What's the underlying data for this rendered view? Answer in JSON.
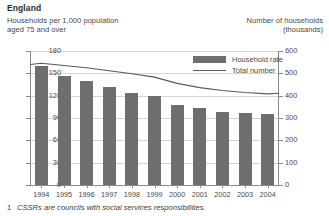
{
  "header": {
    "country": "England",
    "left_axis_title_line1": "Households per 1,000 population",
    "left_axis_title_line2": "aged 75 and over",
    "right_axis_title_line1": "Number of households",
    "right_axis_title_line2": "(thousands)"
  },
  "legend": {
    "position": "inside-top-right",
    "items": [
      {
        "label": "Household rate",
        "marker": "bar-swatch",
        "color": "#6e6e6e"
      },
      {
        "label": "Total number",
        "marker": "line-swatch",
        "color": "#5a5a5a"
      }
    ]
  },
  "footnote": {
    "number": "1",
    "text": "CSSRs are councils with social services responsibilities."
  },
  "chart_data": {
    "type": "bar",
    "title": "England",
    "xlabel": "",
    "ylabel": "Households per 1,000 population aged 75 and over",
    "y2label": "Number of households (thousands)",
    "categories": [
      "1994",
      "1995",
      "1996",
      "1997",
      "1998",
      "1999",
      "2000",
      "2001",
      "2002",
      "2003",
      "2004"
    ],
    "ylim": [
      0,
      180
    ],
    "yticks": [
      0,
      30,
      60,
      90,
      120,
      150,
      180
    ],
    "y2lim": [
      0,
      600
    ],
    "y2ticks": [
      0,
      100,
      200,
      300,
      400,
      500,
      600
    ],
    "grid": true,
    "series": [
      {
        "name": "Household rate",
        "type": "bar",
        "axis": "left",
        "color": "#6e6e6e",
        "values": [
          160,
          147,
          140,
          132,
          124,
          119,
          108,
          103,
          98,
          97,
          96
        ]
      },
      {
        "name": "Total number",
        "type": "line",
        "axis": "right",
        "color": "#5a5a5a",
        "values": [
          545,
          535,
          525,
          512,
          498,
          483,
          455,
          436,
          423,
          414,
          408
        ]
      }
    ]
  }
}
